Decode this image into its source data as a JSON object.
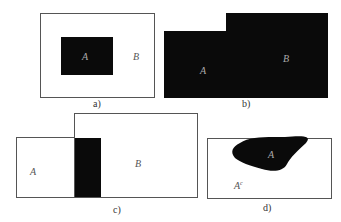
{
  "panels": {
    "a": {
      "caption": "a)",
      "inner_label": "A",
      "outer_label": "B"
    },
    "b": {
      "caption": "b)",
      "label_left": "A",
      "label_right": "B"
    },
    "c": {
      "caption": "c)",
      "label_left": "A",
      "label_right": "B"
    },
    "d": {
      "caption": "d)",
      "inner_label": "A",
      "complement_label": "A",
      "complement_superscript": "c"
    }
  },
  "colors": {
    "fill": "#0a0a0a",
    "border": "#555555",
    "background": "#ffffff"
  }
}
